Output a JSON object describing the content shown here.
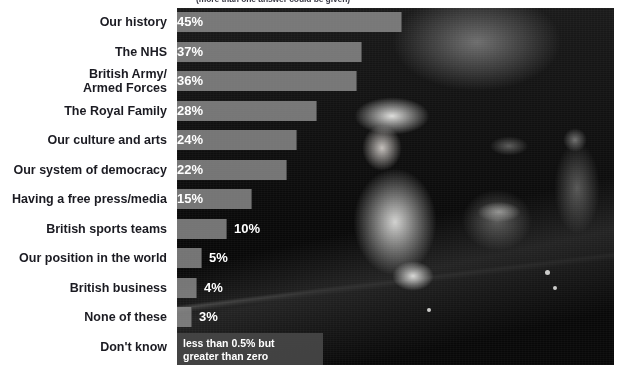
{
  "subtitle": "(more than one answer could be given)",
  "colors": {
    "bar_fill": "#949494",
    "label_text": "#1b1b22",
    "value_text": "#ffffff",
    "panel_background": "#050505",
    "footnote_background": "#464646"
  },
  "footnote": {
    "line1": "less than 0.5% but",
    "line2": "greater than zero"
  },
  "photo": {
    "caption": "black-and-white photograph of the Queen riding in an open carriage beside a uniformed military officer"
  },
  "chart_data": {
    "type": "bar",
    "orientation": "horizontal",
    "title": "",
    "subtitle": "(more than one answer could be given)",
    "xlabel": "",
    "ylabel": "",
    "xlim": [
      0,
      50
    ],
    "grid": false,
    "legend": null,
    "value_suffix": "%",
    "categories": [
      "Our history",
      "The NHS",
      "British Army/\nArmed Forces",
      "The Royal Family",
      "Our culture and arts",
      "Our system of democracy",
      "Having a free press/media",
      "British sports teams",
      "Our position in the world",
      "British business",
      "None of these",
      "Don't know"
    ],
    "values": [
      45,
      37,
      36,
      28,
      24,
      22,
      15,
      10,
      5,
      4,
      3,
      0
    ],
    "labels": [
      "45%",
      "37%",
      "36%",
      "28%",
      "24%",
      "22%",
      "15%",
      "10%",
      "5%",
      "4%",
      "3%",
      "less than 0.5% but greater than zero"
    ]
  },
  "rows": [
    {
      "label_line1": "Our history",
      "label_line2": "",
      "value_label": "45%",
      "value": 45
    },
    {
      "label_line1": "The NHS",
      "label_line2": "",
      "value_label": "37%",
      "value": 37
    },
    {
      "label_line1": "British Army/",
      "label_line2": "Armed Forces",
      "value_label": "36%",
      "value": 36
    },
    {
      "label_line1": "The Royal Family",
      "label_line2": "",
      "value_label": "28%",
      "value": 28
    },
    {
      "label_line1": "Our culture and arts",
      "label_line2": "",
      "value_label": "24%",
      "value": 24
    },
    {
      "label_line1": "Our system of democracy",
      "label_line2": "",
      "value_label": "22%",
      "value": 22
    },
    {
      "label_line1": "Having a free press/media",
      "label_line2": "",
      "value_label": "15%",
      "value": 15
    },
    {
      "label_line1": "British sports teams",
      "label_line2": "",
      "value_label": "10%",
      "value": 10
    },
    {
      "label_line1": "Our position in the world",
      "label_line2": "",
      "value_label": "5%",
      "value": 5
    },
    {
      "label_line1": "British business",
      "label_line2": "",
      "value_label": "4%",
      "value": 4
    },
    {
      "label_line1": "None of these",
      "label_line2": "",
      "value_label": "3%",
      "value": 3
    },
    {
      "label_line1": "Don't know",
      "label_line2": "",
      "value_label": "",
      "value": 0
    }
  ]
}
